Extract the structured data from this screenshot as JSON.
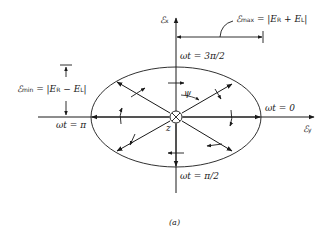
{
  "diagram": {
    "caption": "(a)",
    "axes": {
      "vertical_label": "ℰ",
      "vertical_sub": "x",
      "horizontal_label": "ℰ",
      "horizontal_sub": "y",
      "origin_label": "z"
    },
    "phase_labels": {
      "top": "ωt = 3π/2",
      "right": "ωt = 0",
      "bottom": "ωt = π/2",
      "left": "ωt = π"
    },
    "angle_label": "ψ",
    "max_label": {
      "symbol": "ℰ",
      "sub": "max",
      "expr_prefix": " = |E",
      "sub_r": "R",
      "mid": " + E",
      "sub_l": "L",
      "suffix": "|"
    },
    "min_label": {
      "symbol": "ℰ",
      "sub": "min",
      "expr_prefix": " = |E",
      "sub_r": "R",
      "mid": " − E",
      "sub_l": "L",
      "suffix": "|"
    },
    "colors": {
      "ink": "#1a1a1a",
      "background": "#ffffff"
    }
  }
}
